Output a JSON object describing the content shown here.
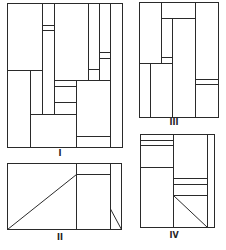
{
  "figure": {
    "panels": [
      {
        "id": "I",
        "label": "I"
      },
      {
        "id": "II",
        "label": "II"
      },
      {
        "id": "III",
        "label": "III"
      },
      {
        "id": "IV",
        "label": "IV"
      }
    ]
  },
  "colors": {
    "line": "#2a2a2a",
    "background": "#ffffff"
  }
}
